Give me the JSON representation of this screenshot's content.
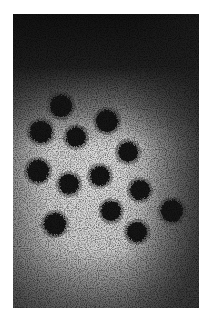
{
  "image": {
    "description": "Grayscale electron micrograph showing round dark viral particles with spiky fringes on a light speckled background",
    "frame": {
      "x": 13,
      "y": 14,
      "width": 186,
      "height": 294
    },
    "colors": {
      "page_background": "#ffffff",
      "dark_region": "#1c1c1c",
      "light_region": "#d8d8d8",
      "particle": "#161616"
    },
    "particles": [
      {
        "cx": 48,
        "cy": 92,
        "r": 11
      },
      {
        "cx": 28,
        "cy": 118,
        "r": 11
      },
      {
        "cx": 63,
        "cy": 123,
        "r": 10
      },
      {
        "cx": 94,
        "cy": 107,
        "r": 11
      },
      {
        "cx": 115,
        "cy": 138,
        "r": 10
      },
      {
        "cx": 25,
        "cy": 157,
        "r": 11
      },
      {
        "cx": 56,
        "cy": 170,
        "r": 10
      },
      {
        "cx": 87,
        "cy": 162,
        "r": 10
      },
      {
        "cx": 127,
        "cy": 176,
        "r": 10
      },
      {
        "cx": 159,
        "cy": 197,
        "r": 11
      },
      {
        "cx": 98,
        "cy": 197,
        "r": 10
      },
      {
        "cx": 42,
        "cy": 210,
        "r": 11
      },
      {
        "cx": 124,
        "cy": 218,
        "r": 10
      }
    ]
  }
}
